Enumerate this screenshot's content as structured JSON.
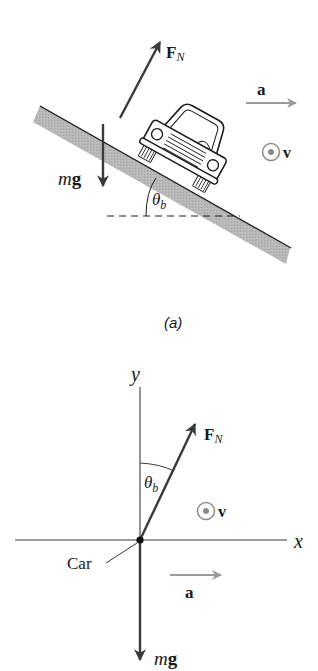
{
  "colors": {
    "ink": "#1a1a1a",
    "force_arrow": "#3a3a3a",
    "accel_arrow": "#9a9a9a",
    "road_fill": "#b5b5b5",
    "velocity_symbol": "#8c8c8c",
    "background": "#ffffff"
  },
  "figure_a": {
    "caption": "(a)",
    "labels": {
      "normal_force": "F",
      "normal_force_sub": "N",
      "gravity_m": "m",
      "gravity_g": "g",
      "acceleration": "a",
      "velocity": "v",
      "bank_angle": "θ",
      "bank_angle_sub": "b"
    }
  },
  "figure_b": {
    "labels": {
      "y_axis": "y",
      "x_axis": "x",
      "normal_force": "F",
      "normal_force_sub": "N",
      "bank_angle": "θ",
      "bank_angle_sub": "b",
      "velocity": "v",
      "car": "Car",
      "acceleration": "a",
      "gravity_m": "m",
      "gravity_g": "g"
    }
  },
  "icons": {
    "velocity_out_of_page": "circle-dot-icon",
    "car": "car-front-icon"
  }
}
